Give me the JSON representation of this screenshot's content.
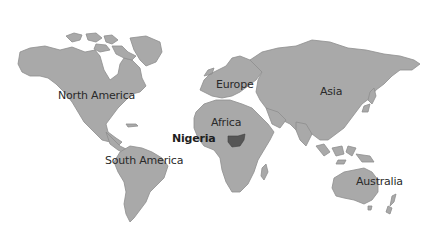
{
  "map": {
    "title": "World map highlighting Nigeria",
    "colors": {
      "land": "#a9a9a9",
      "land_outline": "#8e8e8e",
      "highlight": "#565656",
      "background": "#ffffff",
      "label_text": "#2a2a2a"
    },
    "labels": {
      "north_america": "North America",
      "south_america": "South America",
      "europe": "Europe",
      "africa": "Africa",
      "asia": "Asia",
      "australia": "Australia",
      "nigeria": "Nigeria"
    },
    "highlighted_country": "Nigeria"
  }
}
